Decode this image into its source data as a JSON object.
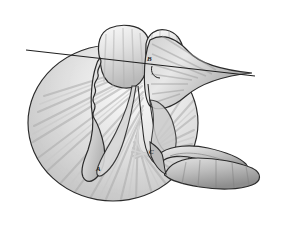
{
  "figure": {
    "kind": "medical-anatomy-illustration",
    "canvas": {
      "width": 282,
      "height": 227
    },
    "background_color": "#ffffff",
    "outline_color": "#2b2b2b",
    "shading": {
      "light_fill": "#f2f2f2",
      "mid_fill": "#c9c9c9",
      "dark_fill": "#9a9a9a",
      "deep_fill": "#7d7d7d",
      "radiating_streak_color": "#b8b8b8"
    }
  },
  "labels": [
    {
      "id": "label-a",
      "text": "A",
      "x": 96,
      "y": 166
    },
    {
      "id": "label-b",
      "text": "B",
      "x": 147,
      "y": 56
    },
    {
      "id": "label-c",
      "text": "C",
      "x": 149,
      "y": 149
    }
  ],
  "parts": [
    {
      "name": "radiating-disc",
      "description": "large fan-shaded circular body occupying left and center"
    },
    {
      "name": "upper-left-lobe",
      "description": "rounded superior lobe at top center"
    },
    {
      "name": "upper-right-lobe",
      "description": "rounded superior lobe right of center"
    },
    {
      "name": "lateral-wing",
      "description": "tapering wing extending to the right from the upper lobes"
    },
    {
      "name": "central-ridge",
      "description": "irregular scalloped vertical ridge through the disc"
    },
    {
      "name": "lower-tube-loop",
      "description": "slender looped tube in lower right"
    },
    {
      "name": "lower-bulb",
      "description": "elongated rounded bulb extending right from the loop"
    },
    {
      "name": "transverse-line",
      "description": "straight thin line crossing the figure horizontally"
    }
  ],
  "meta": {
    "label_count": "3",
    "view_note": "grayscale"
  }
}
